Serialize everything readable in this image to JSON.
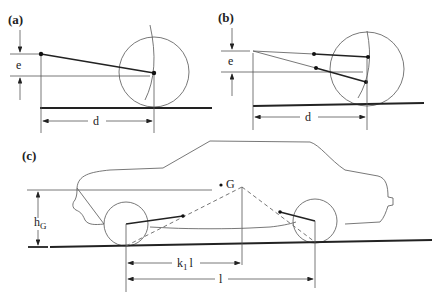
{
  "figure": {
    "panels": [
      {
        "id": "a",
        "label": "(a)",
        "dim_vertical": "e",
        "dim_horizontal": "d"
      },
      {
        "id": "b",
        "label": "(b)",
        "dim_vertical": "e",
        "dim_horizontal": "d"
      },
      {
        "id": "c",
        "label": "(c)",
        "dim_height": "h",
        "dim_height_sub": "G",
        "cg_label": "G",
        "dim_k": "k",
        "dim_k_sub": "1",
        "dim_k_tail": "l",
        "dim_wheelbase": "l"
      }
    ]
  },
  "colors": {
    "line": "#222222",
    "background": "#ffffff"
  }
}
